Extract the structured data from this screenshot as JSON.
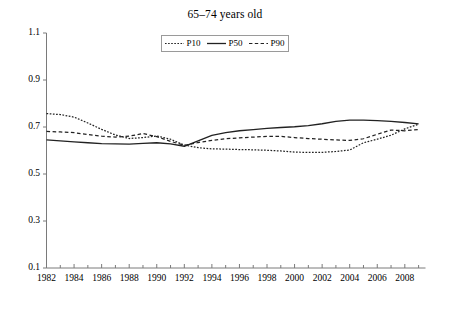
{
  "chart_data": {
    "type": "line",
    "title": "65–74 years old",
    "xlabel": "",
    "ylabel": "",
    "xlim": [
      1982,
      2009.5
    ],
    "ylim": [
      0.1,
      1.1
    ],
    "yticks": [
      "1.1",
      "0.9",
      "0.7",
      "0.5",
      "0.3",
      "0.1"
    ],
    "ytick_values": [
      1.1,
      0.9,
      0.7,
      0.5,
      0.3,
      0.1
    ],
    "xticks": [
      "1982",
      "1984",
      "1986",
      "1988",
      "1990",
      "1992",
      "1994",
      "1996",
      "1998",
      "2000",
      "2002",
      "2004",
      "2006",
      "2008"
    ],
    "xtick_values": [
      1982,
      1984,
      1986,
      1988,
      1990,
      1992,
      1994,
      1996,
      1998,
      2000,
      2002,
      2004,
      2006,
      2008
    ],
    "minor_xticks": [
      1983,
      1985,
      1987,
      1989,
      1991,
      1993,
      1995,
      1997,
      1999,
      2001,
      2003,
      2005,
      2007,
      2009
    ],
    "grid": false,
    "legend_position": "top-center",
    "legend_box": true,
    "x": [
      1982,
      1983,
      1984,
      1985,
      1986,
      1987,
      1988,
      1989,
      1990,
      1991,
      1992,
      1993,
      1994,
      1995,
      1996,
      1997,
      1998,
      1999,
      2000,
      2001,
      2002,
      2003,
      2004,
      2005,
      2006,
      2007,
      2008,
      2009
    ],
    "series": [
      {
        "name": "P10",
        "style": "dotted",
        "color": "#222222",
        "values": [
          0.757,
          0.753,
          0.742,
          0.717,
          0.69,
          0.666,
          0.651,
          0.655,
          0.662,
          0.648,
          0.623,
          0.612,
          0.607,
          0.606,
          0.604,
          0.603,
          0.601,
          0.598,
          0.593,
          0.592,
          0.592,
          0.596,
          0.602,
          0.633,
          0.648,
          0.665,
          0.692,
          0.712
        ]
      },
      {
        "name": "P50",
        "style": "solid",
        "color": "#222222",
        "values": [
          0.645,
          0.641,
          0.637,
          0.633,
          0.629,
          0.628,
          0.627,
          0.63,
          0.633,
          0.628,
          0.618,
          0.641,
          0.664,
          0.676,
          0.684,
          0.689,
          0.694,
          0.698,
          0.701,
          0.706,
          0.714,
          0.724,
          0.729,
          0.729,
          0.727,
          0.724,
          0.719,
          0.713
        ]
      },
      {
        "name": "P90",
        "style": "dashed",
        "color": "#222222",
        "values": [
          0.681,
          0.679,
          0.676,
          0.668,
          0.661,
          0.657,
          0.661,
          0.672,
          0.659,
          0.639,
          0.622,
          0.634,
          0.643,
          0.65,
          0.654,
          0.657,
          0.66,
          0.66,
          0.655,
          0.651,
          0.648,
          0.645,
          0.643,
          0.65,
          0.669,
          0.687,
          0.684,
          0.689
        ]
      }
    ],
    "legend": [
      {
        "label": "P10",
        "style": "dotted"
      },
      {
        "label": "P50",
        "style": "solid"
      },
      {
        "label": "P90",
        "style": "dashed"
      }
    ]
  },
  "axes": {
    "axis_color": "#7a7a7a"
  }
}
